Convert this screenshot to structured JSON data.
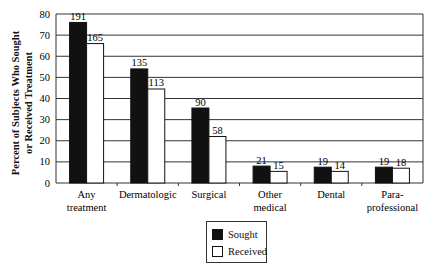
{
  "chart_data": {
    "type": "bar",
    "title": "",
    "xlabel": "",
    "ylabel": "Percent of Subjects Who Sought or Received Treatment",
    "ylabel_lines": [
      "Percent of Subjects Who Sought",
      "or Received Treatment"
    ],
    "ylim": [
      0,
      80
    ],
    "yticks": [
      0,
      10,
      20,
      30,
      40,
      50,
      60,
      70,
      80
    ],
    "grid": true,
    "legend_position": "bottom-center",
    "categories": [
      "Any treatment",
      "Dermatologic",
      "Surgical",
      "Other medical",
      "Dental",
      "Para-professional"
    ],
    "category_lines": [
      [
        "Any",
        "treatment"
      ],
      [
        "Dermatologic"
      ],
      [
        "Surgical"
      ],
      [
        "Other",
        "medical"
      ],
      [
        "Dental"
      ],
      [
        "Para-",
        "professional"
      ]
    ],
    "series": [
      {
        "name": "Sought",
        "color": "#111111",
        "values": [
          76,
          54,
          35.5,
          8,
          7.5,
          7.5
        ],
        "labels": [
          "191",
          "135",
          "90",
          "21",
          "19",
          "19"
        ]
      },
      {
        "name": "Received",
        "color": "#ffffff",
        "values": [
          66,
          44.5,
          22,
          5.5,
          5.5,
          7
        ],
        "labels": [
          "165",
          "113",
          "58",
          "15",
          "14",
          "18"
        ]
      }
    ]
  },
  "legend": {
    "items": [
      {
        "label": "Sought",
        "color": "#111111"
      },
      {
        "label": "Received",
        "color": "#ffffff"
      }
    ]
  }
}
